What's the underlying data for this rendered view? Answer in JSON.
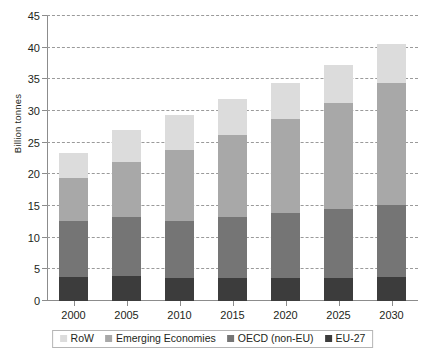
{
  "chart_data": {
    "type": "bar",
    "stacked": true,
    "title": "",
    "xlabel": "",
    "ylabel": "Billion tonnes",
    "categories": [
      "2000",
      "2005",
      "2010",
      "2015",
      "2020",
      "2025",
      "2030"
    ],
    "ylim": [
      0,
      45
    ],
    "yticks": [
      0,
      5,
      10,
      15,
      20,
      25,
      30,
      35,
      40,
      45
    ],
    "ytick_labels": [
      "0",
      "5",
      "10",
      "15",
      "20",
      "25",
      "30",
      "35",
      "40",
      "45"
    ],
    "grid": true,
    "legend_position": "bottom",
    "series": [
      {
        "name": "EU-27",
        "color": "#3c3c3c",
        "values": [
          3.8,
          4.0,
          3.7,
          3.7,
          3.7,
          3.7,
          3.8
        ]
      },
      {
        "name": "OECD (non-EU)",
        "color": "#757575",
        "values": [
          8.9,
          9.2,
          8.9,
          9.5,
          10.2,
          10.9,
          11.3
        ]
      },
      {
        "name": "Emerging Economies",
        "color": "#a8a8a8",
        "values": [
          6.8,
          8.7,
          11.2,
          13.0,
          14.8,
          16.7,
          19.4
        ]
      },
      {
        "name": "RoW",
        "color": "#dcdcdc",
        "values": [
          3.8,
          5.1,
          5.5,
          5.7,
          5.7,
          5.9,
          6.1
        ]
      }
    ],
    "cumulative_tops": {
      "EU-27": [
        3.8,
        4.0,
        3.7,
        3.7,
        3.7,
        3.7,
        3.8
      ],
      "OECD (non-EU)": [
        12.7,
        13.2,
        12.6,
        13.2,
        13.9,
        14.6,
        15.1
      ],
      "Emerging Economies": [
        19.5,
        21.9,
        23.8,
        26.2,
        28.7,
        31.3,
        34.5
      ],
      "RoW": [
        23.3,
        27.0,
        29.3,
        31.9,
        34.4,
        37.2,
        40.6
      ]
    },
    "totals": [
      23.3,
      27.0,
      29.3,
      31.9,
      34.4,
      37.2,
      40.6
    ]
  },
  "legend": {
    "items": [
      {
        "label": "RoW",
        "color": "#dcdcdc"
      },
      {
        "label": "Emerging Economies",
        "color": "#a8a8a8"
      },
      {
        "label": "OECD (non-EU)",
        "color": "#757575"
      },
      {
        "label": "EU-27",
        "color": "#3c3c3c"
      }
    ]
  }
}
